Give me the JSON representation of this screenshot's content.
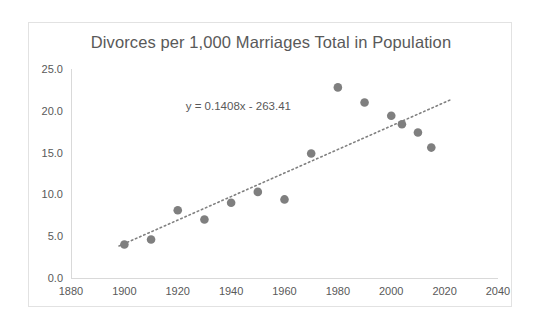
{
  "chart_data": {
    "type": "scatter",
    "title": "Divorces per 1,000 Marriages Total in Population",
    "xlabel": "",
    "ylabel": "",
    "xlim": [
      1880,
      2040
    ],
    "ylim": [
      0.0,
      25.0
    ],
    "grid": false,
    "legend": "none",
    "x_ticks": [
      "1880",
      "1900",
      "1920",
      "1940",
      "1960",
      "1980",
      "2000",
      "2020",
      "2040"
    ],
    "x_tick_values": [
      1880,
      1900,
      1920,
      1940,
      1960,
      1980,
      2000,
      2020,
      2040
    ],
    "y_ticks": [
      "0.0",
      "5.0",
      "10.0",
      "15.0",
      "20.0",
      "25.0"
    ],
    "y_tick_values": [
      0.0,
      5.0,
      10.0,
      15.0,
      20.0,
      25.0
    ],
    "series": [
      {
        "name": "Divorces per 1,000 Marriages",
        "marker": "circle",
        "color": "#7f7f7f",
        "x": [
          1900,
          1910,
          1920,
          1930,
          1940,
          1950,
          1960,
          1970,
          1980,
          1990,
          2000,
          2004,
          2010,
          2015
        ],
        "y": [
          4.0,
          4.6,
          8.1,
          7.0,
          9.0,
          10.3,
          9.4,
          14.9,
          22.8,
          21.0,
          19.4,
          18.4,
          17.4,
          15.6
        ]
      }
    ],
    "trendline": {
      "equation": "y = 0.1408x - 263.41",
      "slope": 0.1408,
      "intercept": -263.41,
      "style": "dotted",
      "color": "#808080",
      "x_start": 1898,
      "x_end": 2022
    },
    "annotations": [
      {
        "name": "trendline-equation",
        "text": "y = 0.1408x - 263.41",
        "x": 1923,
        "y": 20.1
      }
    ],
    "colors": {
      "marker": "#7f7f7f",
      "trendline": "#808080",
      "axis": "#d9d9d9",
      "text": "#595959",
      "frame": "#e2e2e2",
      "background": "#ffffff"
    }
  }
}
